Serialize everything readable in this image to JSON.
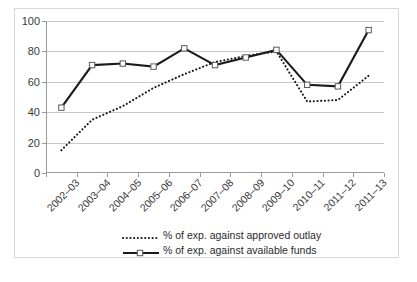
{
  "chart_data": {
    "type": "line",
    "title": "",
    "xlabel": "",
    "ylabel": "",
    "ylim": [
      0,
      100
    ],
    "ytick_step": 20,
    "yticks": [
      "0",
      "20",
      "40",
      "60",
      "80",
      "100"
    ],
    "grid": true,
    "legend_position": "bottom-center",
    "categories": [
      "2002–03",
      "2003–04",
      "2004–05",
      "2005–06",
      "2006–07",
      "2007–08",
      "2008–09",
      "2009–10",
      "2010–11",
      "2011–12",
      "2011–13"
    ],
    "series": [
      {
        "name": "% of exp. against approved outlay",
        "style": "dotted",
        "marker": "none",
        "color": "#1a1a1a",
        "values": [
          15,
          35,
          44,
          56,
          65,
          73,
          77,
          80,
          47,
          48,
          64
        ]
      },
      {
        "name": "% of exp. against available funds",
        "style": "solid",
        "marker": "square",
        "color": "#1a1a1a",
        "values": [
          43,
          71,
          72,
          70,
          82,
          71,
          76,
          81,
          58,
          57,
          94
        ]
      }
    ]
  },
  "legend": {
    "items": [
      {
        "label": "% of exp. against approved outlay",
        "style": "dotted"
      },
      {
        "label": "% of exp. against available funds",
        "style": "solid-square"
      }
    ]
  },
  "colors": {
    "frame": "#d8d8d8",
    "gridline": "#c9c9c9",
    "axis": "#9a9a9a",
    "series": "#1a1a1a",
    "marker_fill": "#ffffff",
    "marker_stroke": "#5a5a5a",
    "text": "#3a3a3a",
    "background": "#ffffff"
  }
}
